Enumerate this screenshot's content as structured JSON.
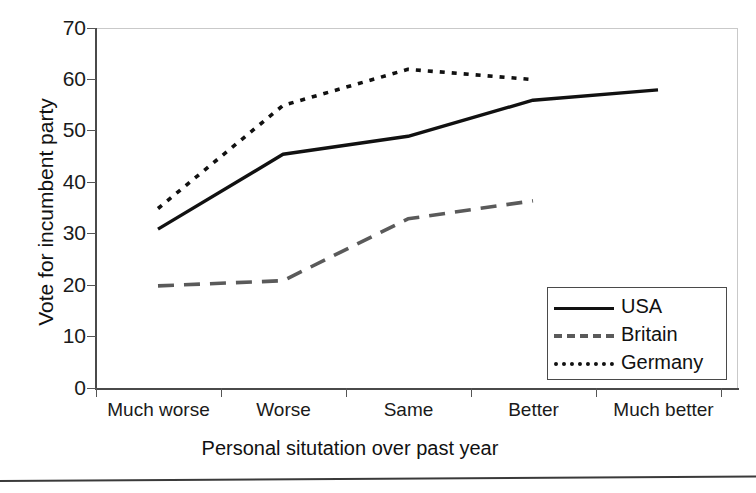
{
  "chart_data": {
    "type": "line",
    "title": "",
    "xlabel": "Personal situtation over past year",
    "ylabel": "Vote for incumbent party",
    "categories": [
      "Much worse",
      "Worse",
      "Same",
      "Better",
      "Much better"
    ],
    "ylim": [
      0,
      70
    ],
    "ytick_step": 10,
    "yticks": [
      "70",
      "60",
      "50",
      "40",
      "30",
      "20",
      "10",
      "0"
    ],
    "grid": false,
    "legend_position": "lower-right-inside",
    "series": [
      {
        "name": "USA",
        "style": "solid",
        "color": "#111111",
        "values": [
          31,
          45.5,
          49,
          56,
          58
        ]
      },
      {
        "name": "Britain",
        "style": "dashed",
        "color": "#5a5a5a",
        "values": [
          20,
          21,
          33,
          36.5,
          null
        ]
      },
      {
        "name": "Germany",
        "style": "dotted",
        "color": "#111111",
        "values": [
          35,
          55,
          62,
          60,
          null
        ]
      }
    ]
  },
  "axis": {
    "y_title": "Vote for incumbent party",
    "x_title": "Personal situtation over past year",
    "y_ticks": [
      {
        "label": "70"
      },
      {
        "label": "60"
      },
      {
        "label": "50"
      },
      {
        "label": "40"
      },
      {
        "label": "30"
      },
      {
        "label": "20"
      },
      {
        "label": "10"
      },
      {
        "label": "0"
      }
    ],
    "x_ticks": [
      {
        "label": "Much worse"
      },
      {
        "label": "Worse"
      },
      {
        "label": "Same"
      },
      {
        "label": "Better"
      },
      {
        "label": "Much better"
      }
    ]
  },
  "legend": {
    "entries": [
      {
        "label": "USA",
        "style": "solid"
      },
      {
        "label": "Britain",
        "style": "dashed"
      },
      {
        "label": "Germany",
        "style": "dotted"
      }
    ]
  }
}
